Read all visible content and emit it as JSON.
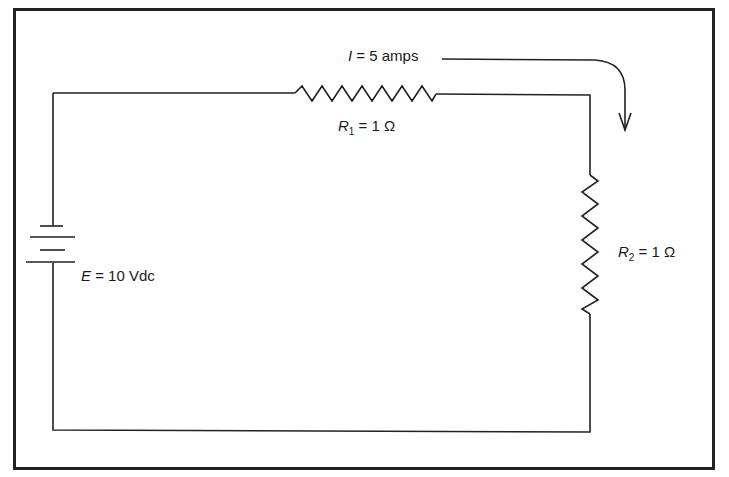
{
  "diagram": {
    "type": "series-circuit",
    "current_label": {
      "symbol": "I",
      "text": "= 5 amps"
    },
    "r1_label": {
      "symbol": "R",
      "sub": "1",
      "text": "= 1 Ω"
    },
    "r2_label": {
      "symbol": "R",
      "sub": "2",
      "text": "= 1 Ω"
    },
    "source_label": {
      "symbol": "E",
      "text": "= 10 Vdc"
    },
    "line_color": "#222222"
  }
}
